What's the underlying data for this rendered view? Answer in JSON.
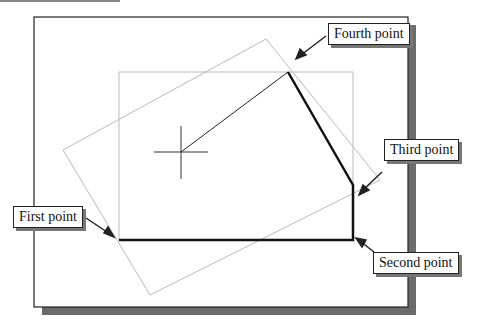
{
  "labels": {
    "first": "First point",
    "second": "Second point",
    "third": "Third point",
    "fourth": "Fourth point"
  },
  "points": {
    "first": [
      119,
      240
    ],
    "second": [
      353,
      240
    ],
    "third": [
      353,
      185
    ],
    "fourth": [
      288,
      72
    ]
  },
  "colors": {
    "frame": "#222222",
    "shadow": "#6b6b6b",
    "thin_gray": "#b8b8b8",
    "polyline": "#111111"
  }
}
